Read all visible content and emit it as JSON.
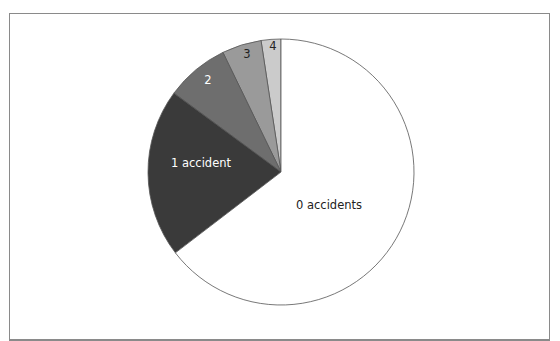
{
  "chart_data": {
    "type": "pie",
    "title": "",
    "start_angle_deg": 0,
    "direction": "counterclockwise",
    "categories": [
      "0 accidents",
      "1 accident",
      "2",
      "3",
      "4"
    ],
    "values": [
      64.6,
      20.5,
      7.7,
      4.8,
      2.4
    ],
    "colors": [
      "#ffffff",
      "#3a3a3a",
      "#6e6e6e",
      "#9a9a9a",
      "#cbcbcb"
    ],
    "label_colors": [
      "#222222",
      "#ffffff",
      "#ffffff",
      "#222222",
      "#222222"
    ],
    "legend": "none",
    "labels_inside": true
  },
  "labels": {
    "slice0": "0 accidents",
    "slice1": "1 accident",
    "slice2": "2",
    "slice3": "3",
    "slice4": "4"
  }
}
